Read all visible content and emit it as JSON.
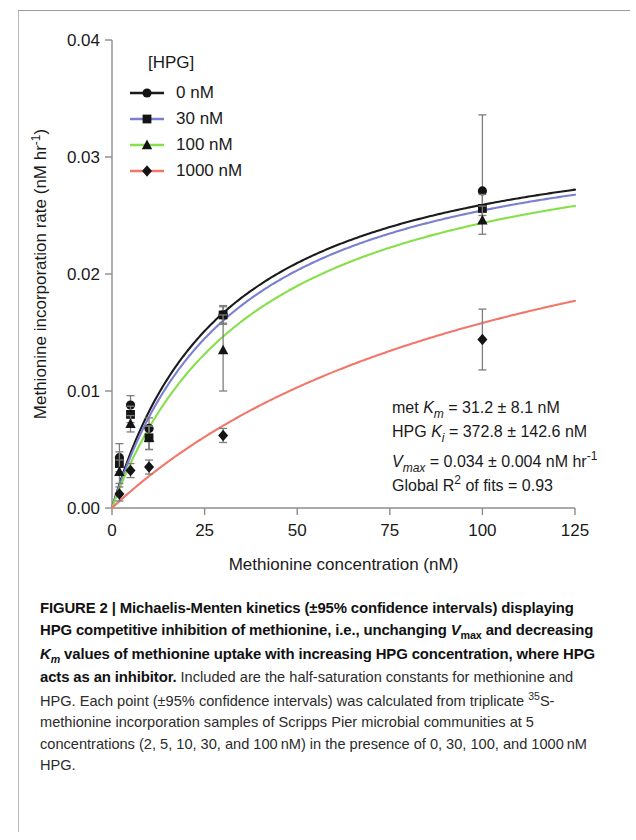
{
  "figure": {
    "axes": {
      "x_title": "Methionine concentration (nM)",
      "y_title_main": "Methionine incorporation rate (nM hr",
      "y_title_sup": "-1",
      "y_title_tail": ")",
      "x_ticks": [
        "0",
        "25",
        "50",
        "75",
        "100",
        "125"
      ],
      "y_ticks": [
        "0.00",
        "0.01",
        "0.02",
        "0.03",
        "0.04"
      ]
    },
    "legend": {
      "title": "[HPG]",
      "items": [
        {
          "label": "0 nM",
          "color": "#1b1b1b",
          "marker": "circle"
        },
        {
          "label": "30 nM",
          "color": "#7a7fd0",
          "marker": "square"
        },
        {
          "label": "100 nM",
          "color": "#86e04a",
          "marker": "triangle"
        },
        {
          "label": "1000 nM",
          "color": "#f2776a",
          "marker": "diamond"
        }
      ]
    },
    "annotation": {
      "line1_pre": "met ",
      "line1_sym": "K",
      "line1_sub": "m",
      "line1_post": " = 31.2 ± 8.1 nM",
      "line2_pre": "HPG ",
      "line2_sym": "K",
      "line2_sub": "i",
      "line2_post": " = 372.8 ± 142.6 nM",
      "line3_sym": "V",
      "line3_sub": "max",
      "line3_post": " = 0.034 ± 0.004 nM hr",
      "line3_sup": "-1",
      "line4_pre": "Global R",
      "line4_sup": "2",
      "line4_post": " of fits = 0.93"
    }
  },
  "chart_data": {
    "type": "scatter",
    "xlabel": "Methionine concentration (nM)",
    "ylabel": "Methionine incorporation rate (nM hr-1)",
    "xlim": [
      0,
      125
    ],
    "ylim": [
      0.0,
      0.04
    ],
    "xticks": [
      0,
      25,
      50,
      75,
      100,
      125
    ],
    "yticks": [
      0.0,
      0.01,
      0.02,
      0.03,
      0.04
    ],
    "grid": false,
    "legend_position": "upper-left",
    "legend_title": "[HPG]",
    "fit_model": "Michaelis-Menten competitive inhibition: V = Vmax*S/(Km_app + S)",
    "fit_params": {
      "Vmax": 0.034,
      "Vmax_ci": 0.004,
      "Km_met": 31.2,
      "Km_met_ci": 8.1,
      "Ki_HPG": 372.8,
      "Ki_HPG_ci": 142.6,
      "R2_global": 0.93
    },
    "x": [
      2,
      5,
      10,
      30,
      100
    ],
    "series": [
      {
        "name": "0 nM",
        "color": "#1b1b1b",
        "marker": "circle",
        "km_app": 31.2,
        "values": [
          0.0043,
          0.0088,
          0.0068,
          0.0165,
          0.0271
        ],
        "err_low": [
          0.0012,
          0.0008,
          0.0009,
          0.0008,
          0.0021
        ],
        "err_high": [
          0.0012,
          0.0008,
          0.0009,
          0.0008,
          0.0065
        ]
      },
      {
        "name": "30 nM",
        "color": "#7a7fd0",
        "marker": "square",
        "km_app": 33.7,
        "values": [
          0.0038,
          0.008,
          0.006,
          0.0165,
          0.0256
        ],
        "err_low": [
          0.001,
          0.0007,
          0.001,
          0.0007,
          0.0012
        ],
        "err_high": [
          0.001,
          0.0007,
          0.001,
          0.0007,
          0.0012
        ]
      },
      {
        "name": "100 nM",
        "color": "#86e04a",
        "marker": "triangle",
        "km_app": 39.6,
        "values": [
          0.0031,
          0.0072,
          0.006,
          0.0135,
          0.0246
        ],
        "err_low": [
          0.001,
          0.0007,
          0.001,
          0.0035,
          0.0012
        ],
        "err_high": [
          0.001,
          0.0007,
          0.001,
          0.003,
          0.0012
        ]
      },
      {
        "name": "1000 nM",
        "color": "#f2776a",
        "marker": "diamond",
        "km_app": 115.0,
        "values": [
          0.0012,
          0.0032,
          0.0035,
          0.0062,
          0.0144
        ],
        "err_low": [
          0.0006,
          0.0006,
          0.0006,
          0.0006,
          0.0026
        ],
        "err_high": [
          0.0006,
          0.0006,
          0.0006,
          0.0006,
          0.0026
        ]
      }
    ]
  },
  "caption": {
    "figure_label": "FIGURE 2 | ",
    "lead_1": "Michaelis-Menten kinetics (±95% confidence intervals) displaying HPG competitive inhibition of methionine, i.e., unchanging ",
    "lead_v": "V",
    "lead_v_sub": "max",
    "lead_2": " and decreasing ",
    "lead_k": "K",
    "lead_k_sub": "m",
    "lead_3": " values of methionine uptake with increasing HPG concentration, where HPG acts as an inhibitor.",
    "body_1": " Included are the half-saturation constants for methionine and HPG. Each point (±95% confidence intervals) was calculated from triplicate ",
    "body_sup": "35",
    "body_2": "S-methionine incorporation samples of Scripps Pier microbial communities at 5 concentrations (2, 5, 10, 30, and 100 nM) in the presence of 0, 30, 100, and 1000 nM HPG."
  }
}
